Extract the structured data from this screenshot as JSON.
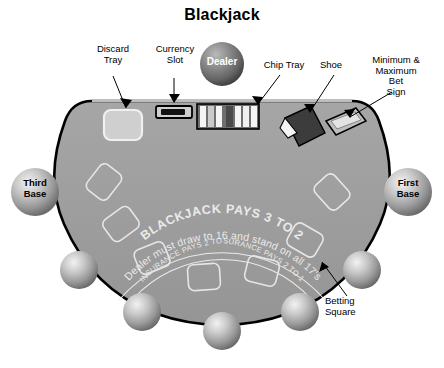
{
  "title": "Blackjack",
  "table": {
    "felt_color": "#9a9a9a",
    "edge_color": "#000000",
    "print_color": "#e8e8e8",
    "printed_text": {
      "headline": "BLACKJACK PAYS 3 TO 2",
      "rule": "Dealer must draw to 16 and stand on all 17's",
      "insurance_left": "INSURANCE PAYS 2 TO 1",
      "insurance_right": "INSURANCE PAYS 2 TO 1"
    }
  },
  "callouts": [
    {
      "id": "discard-tray",
      "label": "Discard\nTray"
    },
    {
      "id": "currency-slot",
      "label": "Currency\nSlot"
    },
    {
      "id": "chip-tray",
      "label": "Chip Tray"
    },
    {
      "id": "shoe",
      "label": "Shoe"
    },
    {
      "id": "bet-sign",
      "label": "Minimum &\nMaximum\nBet\nSign"
    },
    {
      "id": "betting-square",
      "label": "Betting\nSquare"
    }
  ],
  "positions": {
    "dealer": {
      "label": "Dealer",
      "color": "#6f6f6f",
      "text_color": "#ffffff"
    },
    "third_base": {
      "label": "Third\nBase",
      "color": "#9a9a9a",
      "text_color": "#000000"
    },
    "first_base": {
      "label": "First\nBase",
      "color": "#9a9a9a",
      "text_color": "#000000"
    },
    "player_count": 5
  },
  "equipment": {
    "discard_tray_color": "#d6d6d6",
    "currency_slot_color": "#1a1a1a",
    "chip_tray_color": "#f2f2f2",
    "shoe_color": "#3a3a3a",
    "bet_sign_color": "#c9c9c9"
  }
}
